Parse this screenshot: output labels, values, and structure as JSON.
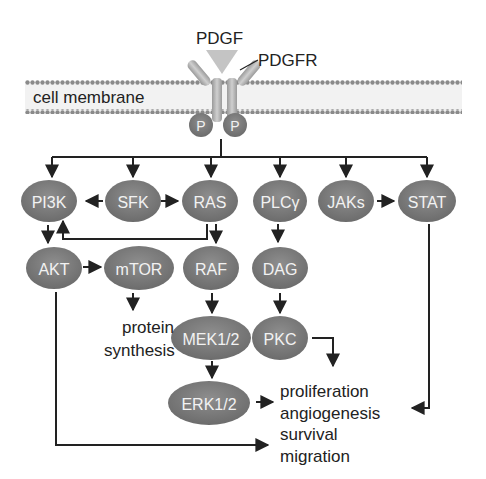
{
  "labels": {
    "ligand": "PDGF",
    "receptor": "PDGFR",
    "membrane": "cell membrane",
    "phospho_left": "P",
    "phospho_right": "P",
    "protein_synthesis_1": "protein",
    "protein_synthesis_2": "synthesis",
    "outcomes": [
      "proliferation",
      "angiogenesis",
      "survival",
      "migration"
    ]
  },
  "nodes": {
    "pi3k": "PI3K",
    "sfk": "SFK",
    "ras": "RAS",
    "plcy": "PLCγ",
    "jaks": "JAKs",
    "stat": "STAT",
    "akt": "AKT",
    "mtor": "mTOR",
    "raf": "RAF",
    "dag": "DAG",
    "mek": "MEK1/2",
    "pkc": "PKC",
    "erk": "ERK1/2"
  },
  "colors": {
    "node_fill": "#7a7a7a",
    "node_text": "#f2f2f2",
    "arrow": "#222222",
    "membrane_head": "#8a8a8a",
    "ligand": "#bdbdbd",
    "receptor": "#a8a8a8"
  }
}
